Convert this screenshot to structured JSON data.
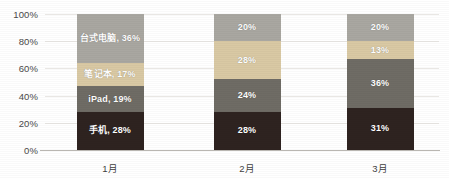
{
  "chart_data": {
    "type": "bar",
    "stacked": true,
    "stack_total": 100,
    "title": "",
    "subtitle": "",
    "xlabel": "",
    "ylabel": "",
    "categories": [
      "1月",
      "2月",
      "3月"
    ],
    "ylim": [
      0,
      100
    ],
    "y_ticks": [
      0,
      20,
      40,
      60,
      80,
      100
    ],
    "y_tick_labels": [
      "0%",
      "20%",
      "40%",
      "60%",
      "80%",
      "100%"
    ],
    "grid": true,
    "legend": "none",
    "series": [
      {
        "name": "手机",
        "color": "#2e2320",
        "values": [
          28,
          28,
          31
        ],
        "labels": [
          "手机, 28%",
          "28%",
          "31%"
        ]
      },
      {
        "name": "iPad",
        "color": "#6f6c65",
        "values": [
          19,
          24,
          36
        ],
        "labels": [
          "iPad, 19%",
          "24%",
          "36%"
        ]
      },
      {
        "name": "笔记本",
        "color": "#d9c9a4",
        "values": [
          17,
          28,
          13
        ],
        "labels": [
          "笔记本, 17%",
          "28%",
          "13%"
        ]
      },
      {
        "name": "台式电脑",
        "color": "#a9a7a1",
        "values": [
          36,
          20,
          20
        ],
        "labels": [
          "台式电脑, 36%",
          "20%",
          "20%"
        ]
      }
    ]
  },
  "axis": {
    "y_labels": [
      "100%",
      "80%",
      "60%",
      "40%",
      "20%",
      "0%"
    ],
    "x_labels": [
      "1月",
      "2月",
      "3月"
    ]
  },
  "bars": [
    {
      "category": "1月",
      "segments": [
        {
          "series": "手机",
          "value": 28,
          "label": "手机, 28%",
          "color": "#2e2320"
        },
        {
          "series": "iPad",
          "value": 19,
          "label": "iPad, 19%",
          "color": "#6f6c65"
        },
        {
          "series": "笔记本",
          "value": 17,
          "label": "笔记本, 17%",
          "color": "#d9c9a4"
        },
        {
          "series": "台式电脑",
          "value": 36,
          "label": "台式电脑, 36%",
          "color": "#a9a7a1"
        }
      ]
    },
    {
      "category": "2月",
      "segments": [
        {
          "series": "手机",
          "value": 28,
          "label": "28%",
          "color": "#2e2320"
        },
        {
          "series": "iPad",
          "value": 24,
          "label": "24%",
          "color": "#6f6c65"
        },
        {
          "series": "笔记本",
          "value": 28,
          "label": "28%",
          "color": "#d9c9a4"
        },
        {
          "series": "台式电脑",
          "value": 20,
          "label": "20%",
          "color": "#a9a7a1"
        }
      ]
    },
    {
      "category": "3月",
      "segments": [
        {
          "series": "手机",
          "value": 31,
          "label": "31%",
          "color": "#2e2320"
        },
        {
          "series": "iPad",
          "value": 36,
          "label": "36%",
          "color": "#6f6c65"
        },
        {
          "series": "笔记本",
          "value": 13,
          "label": "13%",
          "color": "#d9c9a4"
        },
        {
          "series": "台式电脑",
          "value": 20,
          "label": "20%",
          "color": "#a9a7a1"
        }
      ]
    }
  ],
  "layout": {
    "bar_width_px": 67,
    "bar_centers_px": [
      110,
      247,
      380
    ],
    "plot_left_px": 45,
    "plot_top_px": 14,
    "plot_width_px": 394,
    "plot_height_px": 136
  },
  "colors": {
    "background": "#ffffff",
    "gridline": "#e9e7e4",
    "axis_line": "#b9b6b1",
    "label_text": "#ffffff",
    "tick_text": "#4a4a4a"
  }
}
